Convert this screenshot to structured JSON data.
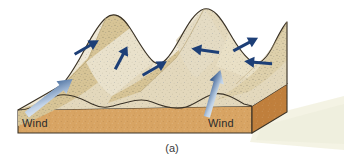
{
  "figure": {
    "caption": "(a)",
    "labels": [
      {
        "name": "wind-label-left",
        "text": "Wind"
      },
      {
        "name": "wind-label-right",
        "text": "Wind"
      }
    ]
  },
  "colors": {
    "sand_light": "#e6dcc2",
    "sand_highlight": "#f0e9d8",
    "sand_mid": "#ddd0ab",
    "sand_shadow": "#d2be8e",
    "sand_dark": "#c9b07a",
    "block_front": "#d8a463",
    "block_side": "#c07f3c",
    "outline": "#3a3226",
    "arrow_blue": "#1d3f77",
    "arrow_blue_dark": "#17356a",
    "wind_arrow_light": "#c9d8ea",
    "background": "#ffffff",
    "shadow": "#f2f2e2",
    "speckle": "#6a6a52",
    "text": "#2b2b2b"
  },
  "arrows": {
    "sand_transport": [
      {
        "name": "arrow-slip-1",
        "direction": "up-right",
        "angle_deg": -28
      },
      {
        "name": "arrow-slip-2",
        "direction": "up-right",
        "angle_deg": -62
      },
      {
        "name": "arrow-slip-3",
        "direction": "up-right",
        "angle_deg": -28
      },
      {
        "name": "arrow-slip-4",
        "direction": "left",
        "angle_deg": 186
      },
      {
        "name": "arrow-slip-5",
        "direction": "up-right",
        "angle_deg": -28
      },
      {
        "name": "arrow-slip-6",
        "direction": "left",
        "angle_deg": 184
      }
    ],
    "wind": [
      {
        "name": "wind-arrow-left",
        "direction": "up-right",
        "angle_deg": -38
      },
      {
        "name": "wind-arrow-right",
        "direction": "up",
        "angle_deg": -72
      }
    ]
  }
}
